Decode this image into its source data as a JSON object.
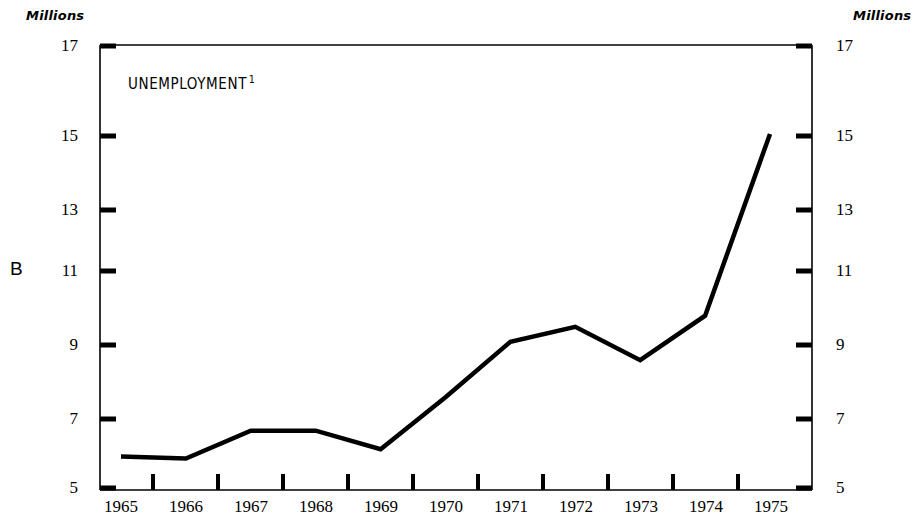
{
  "panel": {
    "letter": "B"
  },
  "axis": {
    "unit_left": "Millions",
    "unit_right": "Millions",
    "y_ticks": [
      "17",
      "15",
      "13",
      "11",
      "9",
      "7",
      "5"
    ],
    "x_labels": [
      "1965",
      "1966",
      "1967",
      "1968",
      "1969",
      "1970",
      "1971",
      "1972",
      "1973",
      "1974",
      "1975"
    ]
  },
  "series": {
    "title": "UNEMPLOYMENT",
    "footnote_marker": "1"
  },
  "colors": {
    "line": "#000000",
    "axis": "#000000",
    "background": "#ffffff"
  },
  "chart_data": {
    "type": "line",
    "title": "UNEMPLOYMENT",
    "xlabel": "",
    "ylabel": "Millions",
    "ylim": [
      5,
      17
    ],
    "ytick_values": [
      17,
      15,
      13,
      11,
      9,
      7,
      5
    ],
    "grid": false,
    "legend": "none",
    "categories": [
      "1965",
      "1966",
      "1967",
      "1968",
      "1969",
      "1970",
      "1971",
      "1972",
      "1973",
      "1974",
      "1975"
    ],
    "series": [
      {
        "name": "Unemployment",
        "values": [
          5.9,
          5.85,
          6.6,
          6.6,
          6.1,
          7.5,
          9.0,
          9.4,
          8.5,
          9.7,
          14.6
        ]
      }
    ],
    "annotations": [
      {
        "text": "UNEMPLOYMENT 1",
        "x": "1965",
        "y": 16.3
      }
    ]
  }
}
